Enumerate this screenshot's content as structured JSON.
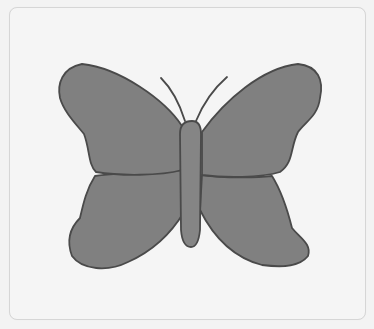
{
  "illustration": {
    "subject": "butterfly",
    "colors": {
      "background": "#f3f3f3",
      "card": "#f5f5f5",
      "card_border": "#d6d6d6",
      "wing_fill": "#808080",
      "outline": "#4a4a4a",
      "body_fill": "#858585"
    },
    "parts": [
      "upper-left-wing",
      "upper-right-wing",
      "lower-left-wing",
      "lower-right-wing",
      "body",
      "left-antenna",
      "right-antenna"
    ]
  }
}
